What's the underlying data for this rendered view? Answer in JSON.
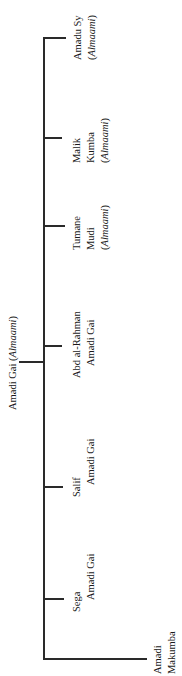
{
  "tree": {
    "parent": {
      "name": "Amadi Gai",
      "title": "Almaami"
    },
    "children": [
      {
        "name": "Amadu Sy",
        "title": "Almaami"
      },
      {
        "name": "Malik Kumba",
        "line1": "Malik",
        "line2": "Kumba",
        "title": "Almaami"
      },
      {
        "name": "Tumane Mudi",
        "line1": "Tumane",
        "line2": "Mudi",
        "title": "Almaami"
      },
      {
        "name": "Abd al-Rahman Amadi Gai",
        "line1": "Abd al-Rahman",
        "line2": "Amadi Gai"
      },
      {
        "name": "Salif Amadi Gai",
        "line1": "Salif",
        "line2": "Amadi Gai"
      },
      {
        "name": "Sega Amadi Gai",
        "line1": "Sega",
        "line2": "Amadi Gai"
      },
      {
        "name": "Amadi Makumba",
        "line1": "Amadi",
        "line2": "Makumba"
      }
    ]
  },
  "colors": {
    "line": "#2a2a2a",
    "text": "#1a1a1a",
    "background": "#ffffff"
  }
}
